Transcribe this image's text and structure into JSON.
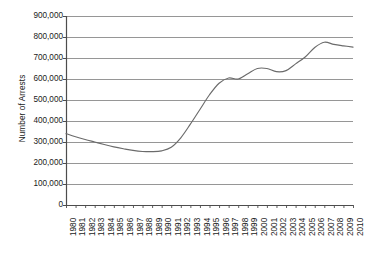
{
  "chart_data": {
    "type": "line",
    "title": "",
    "xlabel": "",
    "ylabel": "Number of Arrests",
    "ylim": [
      0,
      900000
    ],
    "xlim": [
      1980,
      2010
    ],
    "grid": true,
    "legend": "none",
    "y_ticks": [
      "0",
      "100,000",
      "200,000",
      "300,000",
      "400,000",
      "500,000",
      "600,000",
      "700,000",
      "800,000",
      "900,000"
    ],
    "y_tick_values": [
      0,
      100000,
      200000,
      300000,
      400000,
      500000,
      600000,
      700000,
      800000,
      900000
    ],
    "x": [
      1980,
      1981,
      1982,
      1983,
      1984,
      1985,
      1986,
      1987,
      1988,
      1989,
      1990,
      1991,
      1992,
      1993,
      1994,
      1995,
      1996,
      1997,
      1998,
      1999,
      2000,
      2001,
      2002,
      2003,
      2004,
      2005,
      2006,
      2007,
      2008,
      2009,
      2010
    ],
    "categories": [
      "1980",
      "1981",
      "1982",
      "1983",
      "1984",
      "1985",
      "1986",
      "1987",
      "1988",
      "1989",
      "1990",
      "1991",
      "1992",
      "1993",
      "1994",
      "1995",
      "1996",
      "1997",
      "1998",
      "1999",
      "2000",
      "2001",
      "2002",
      "2003",
      "2004",
      "2005",
      "2006",
      "2007",
      "2008",
      "2009",
      "2010"
    ],
    "series": [
      {
        "name": "Number of Arrests",
        "values": [
          340000,
          325000,
          312000,
          300000,
          288000,
          277000,
          268000,
          260000,
          255000,
          254000,
          258000,
          275000,
          320000,
          385000,
          455000,
          525000,
          580000,
          605000,
          600000,
          625000,
          650000,
          650000,
          635000,
          640000,
          672000,
          705000,
          750000,
          775000,
          765000,
          758000,
          752000
        ]
      }
    ],
    "line_color": "#6b6b6b",
    "grid_color": "#8a8a8a",
    "axis_color": "#4d4d4d"
  },
  "caption": {
    "text": ""
  }
}
